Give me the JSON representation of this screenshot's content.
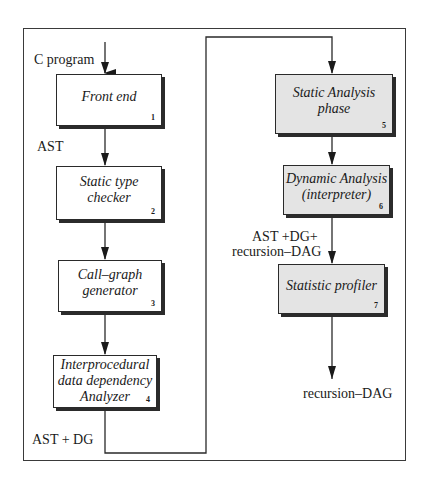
{
  "diagram": {
    "type": "flowchart",
    "left_column": {
      "input_label": "C program",
      "boxes": [
        {
          "id": 1,
          "lines": [
            "Front end"
          ],
          "number": "1"
        },
        {
          "id": 2,
          "lines": [
            "Static type",
            "checker"
          ],
          "number": "2"
        },
        {
          "id": 3,
          "lines": [
            "Call–graph",
            "generator"
          ],
          "number": "3"
        },
        {
          "id": 4,
          "lines": [
            "Interprocedural",
            "data dependency",
            "Analyzer"
          ],
          "number": "4"
        }
      ],
      "edge_labels": {
        "after_1": "AST",
        "after_4": "AST + DG"
      }
    },
    "right_column": {
      "boxes": [
        {
          "id": 5,
          "lines": [
            "Static Analysis",
            "phase"
          ],
          "number": "5"
        },
        {
          "id": 6,
          "lines": [
            "Dynamic Analysis",
            "(interpreter)"
          ],
          "number": "6"
        },
        {
          "id": 7,
          "lines": [
            "Statistic profiler"
          ],
          "number": "7"
        }
      ],
      "edge_labels": {
        "after_6_line1": "AST +DG+",
        "after_6_line2": "recursion–DAG",
        "output": "recursion–DAG"
      }
    },
    "colors": {
      "left_box_fill": "#ffffff",
      "right_box_fill": "#e4e4e4",
      "stroke": "#2a2a2a"
    }
  }
}
